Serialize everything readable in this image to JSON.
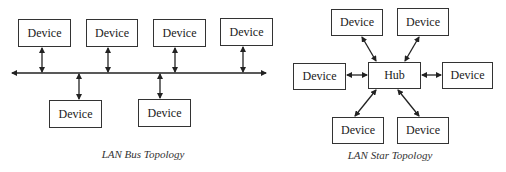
{
  "bus_topology": {
    "caption": "LAN Bus Topology",
    "nodes": [
      {
        "label": "Device"
      },
      {
        "label": "Device"
      },
      {
        "label": "Device"
      },
      {
        "label": "Device"
      },
      {
        "label": "Device"
      },
      {
        "label": "Device"
      }
    ]
  },
  "star_topology": {
    "caption": "LAN Star Topology",
    "hub": {
      "label": "Hub"
    },
    "nodes": [
      {
        "label": "Device"
      },
      {
        "label": "Device"
      },
      {
        "label": "Device"
      },
      {
        "label": "Device"
      },
      {
        "label": "Device"
      },
      {
        "label": "Device"
      }
    ]
  },
  "colors": {
    "line": "#222222",
    "border": "#333333",
    "background": "#ffffff"
  }
}
